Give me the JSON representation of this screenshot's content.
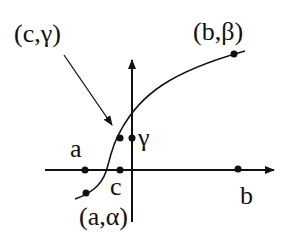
{
  "diagram": {
    "labels": {
      "c_gamma": "(c,γ)",
      "b_beta": "(b,β)",
      "a_alpha": "(a,α)",
      "a": "a",
      "c": "c",
      "b": "b",
      "gamma": "γ"
    },
    "colors": {
      "stroke": "#111111",
      "background": "#ffffff"
    }
  }
}
